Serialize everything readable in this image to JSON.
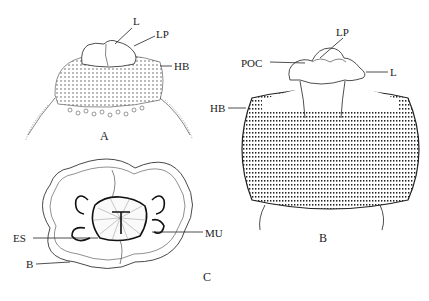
{
  "figure": {
    "panels": [
      {
        "id": "A",
        "label": "A",
        "callouts": [
          {
            "key": "L",
            "text": "L"
          },
          {
            "key": "LP",
            "text": "LP"
          },
          {
            "key": "HB",
            "text": "HB"
          }
        ]
      },
      {
        "id": "B",
        "label": "B",
        "callouts": [
          {
            "key": "LP",
            "text": "LP"
          },
          {
            "key": "POC",
            "text": "POC"
          },
          {
            "key": "L",
            "text": "L"
          },
          {
            "key": "HB",
            "text": "HB"
          }
        ]
      },
      {
        "id": "C",
        "label": "C",
        "callouts": [
          {
            "key": "ES",
            "text": "ES"
          },
          {
            "key": "MU",
            "text": "MU"
          },
          {
            "key": "B",
            "text": "B"
          }
        ]
      }
    ]
  }
}
